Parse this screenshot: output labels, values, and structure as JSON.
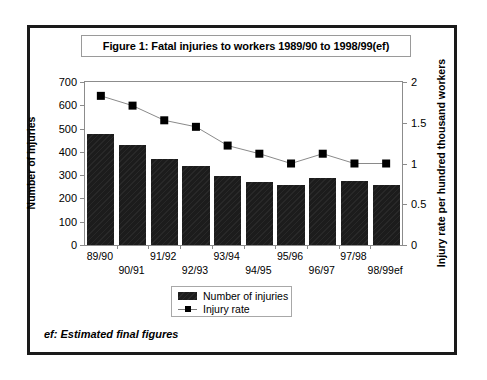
{
  "figure": {
    "title": "Figure 1: Fatal injuries to workers 1989/90 to 1998/99(ef)",
    "footnote": "ef: Estimated final figures"
  },
  "legend": {
    "items": [
      {
        "label": "Number of injuries",
        "marker": "bar-swatch",
        "color": "#1c1c1c"
      },
      {
        "label": "Injury rate",
        "marker": "line-square-marker",
        "color": "#000000"
      }
    ]
  },
  "chart_data": {
    "type": "bar",
    "title": "Figure 1: Fatal injuries to workers 1989/90 to 1998/99(ef)",
    "xlabel": "",
    "ylabel": "Number of injuries",
    "y2label": "Injury rate per hundred thousand workers",
    "categories": [
      "89/90",
      "90/91",
      "91/92",
      "92/93",
      "93/94",
      "94/95",
      "95/96",
      "96/97",
      "97/98",
      "98/99ef"
    ],
    "ylim": [
      0,
      700
    ],
    "yticks": [
      0,
      100,
      200,
      300,
      400,
      500,
      600,
      700
    ],
    "ytick_labels": [
      "0",
      "100",
      "200",
      "300",
      "400",
      "500",
      "600",
      "700"
    ],
    "y2lim": [
      0,
      2
    ],
    "y2ticks": [
      0,
      0.5,
      1,
      1.5,
      2
    ],
    "y2tick_labels": [
      "0",
      "0.5",
      "1",
      "1.5",
      "2"
    ],
    "grid": false,
    "legend_position": "bottom-center",
    "series": [
      {
        "name": "Number of injuries",
        "type": "bar",
        "axis": "left",
        "color": "#1c1c1c",
        "values": [
          475,
          430,
          368,
          340,
          297,
          272,
          259,
          288,
          276,
          258
        ]
      },
      {
        "name": "Injury rate",
        "type": "line",
        "axis": "right",
        "color": "#000000",
        "marker": "square",
        "values": [
          1.83,
          1.71,
          1.53,
          1.45,
          1.22,
          1.12,
          1.0,
          1.12,
          1.0,
          1.0
        ]
      }
    ]
  }
}
